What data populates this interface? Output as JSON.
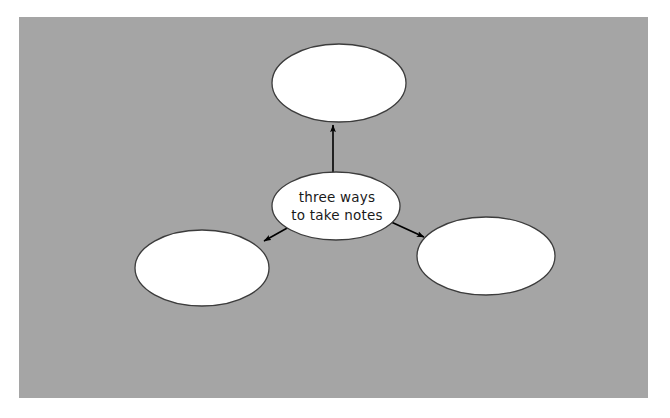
{
  "canvas": {
    "background_color": "#a5a5a5",
    "page_color": "#ffffff",
    "x": 19,
    "y": 17,
    "width": 629,
    "height": 381
  },
  "diagram": {
    "type": "concept-map",
    "title": "three ways to take notes",
    "node_fill": "#ffffff",
    "node_stroke": "#3c3c3c",
    "connector_color": "#000000",
    "nodes": [
      {
        "id": "center",
        "name": "center-node",
        "label_line1": "three ways",
        "label_line2": "to take notes",
        "cx": 336,
        "cy": 206,
        "rx": 64,
        "ry": 34,
        "empty": false
      },
      {
        "id": "top",
        "name": "top-node",
        "label_line1": "",
        "label_line2": "",
        "cx": 339,
        "cy": 83,
        "rx": 67,
        "ry": 39,
        "empty": true
      },
      {
        "id": "bottom-left",
        "name": "bottom-left-node",
        "label_line1": "",
        "label_line2": "",
        "cx": 202,
        "cy": 268,
        "rx": 67,
        "ry": 38,
        "empty": true
      },
      {
        "id": "bottom-right",
        "name": "bottom-right-node",
        "label_line1": "",
        "label_line2": "",
        "cx": 486,
        "cy": 256,
        "rx": 69,
        "ry": 39,
        "empty": true
      }
    ],
    "connectors": [
      {
        "id": "center-to-top",
        "name": "arrow-center-to-top",
        "from": "center",
        "to": "top",
        "x1": 333,
        "y1": 175,
        "x2": 333,
        "y2": 123,
        "direction": "up"
      },
      {
        "id": "center-to-bottom-left",
        "name": "arrow-center-to-bottom-left",
        "from": "center",
        "to": "bottom-left",
        "x1": 289,
        "y1": 227,
        "x2": 262,
        "y2": 242,
        "direction": "down-left"
      },
      {
        "id": "center-to-bottom-right",
        "name": "arrow-center-to-bottom-right",
        "from": "center",
        "to": "bottom-right",
        "x1": 389,
        "y1": 221,
        "x2": 426,
        "y2": 238,
        "direction": "down-right"
      }
    ]
  }
}
